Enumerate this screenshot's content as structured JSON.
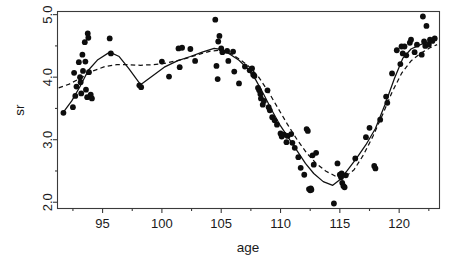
{
  "chart_data": {
    "type": "scatter",
    "title": "",
    "xlabel": "age",
    "ylabel": "sr",
    "xlim": [
      91.2,
      123.4
    ],
    "ylim": [
      1.9,
      5.05
    ],
    "grid": false,
    "legend": "none",
    "xticks": [
      95,
      100,
      105,
      110,
      115,
      120
    ],
    "xtick_labels": [
      "95",
      "100",
      "105",
      "110",
      "115",
      "120"
    ],
    "xminor_ticks": [
      92.5,
      97.5,
      102.5,
      107.5,
      112.5,
      117.5,
      122.5
    ],
    "yticks": [
      2.0,
      3.0,
      4.0,
      5.0
    ],
    "ytick_labels": [
      "2.0",
      "3.0",
      "4.0",
      "5.0"
    ],
    "yminor_ticks": [
      2.5,
      3.5,
      4.5
    ],
    "marker": "filled-circle",
    "marker_color": "#0d0d0d",
    "points": [
      [
        91.7,
        3.43
      ],
      [
        92.5,
        3.52
      ],
      [
        92.6,
        4.07
      ],
      [
        92.7,
        3.7
      ],
      [
        92.8,
        3.85
      ],
      [
        93.0,
        4.24
      ],
      [
        93.1,
        4.0
      ],
      [
        93.15,
        3.92
      ],
      [
        93.2,
        3.74
      ],
      [
        93.3,
        4.36
      ],
      [
        93.35,
        4.1
      ],
      [
        93.5,
        4.56
      ],
      [
        93.55,
        4.25
      ],
      [
        93.6,
        3.8
      ],
      [
        93.7,
        3.68
      ],
      [
        93.75,
        4.7
      ],
      [
        93.8,
        4.63
      ],
      [
        93.85,
        4.08
      ],
      [
        94.0,
        3.72
      ],
      [
        94.1,
        3.66
      ],
      [
        95.6,
        4.62
      ],
      [
        95.7,
        4.38
      ],
      [
        98.1,
        3.87
      ],
      [
        98.25,
        3.84
      ],
      [
        100.0,
        4.25
      ],
      [
        100.6,
        4.01
      ],
      [
        101.4,
        4.46
      ],
      [
        101.5,
        4.16
      ],
      [
        101.7,
        4.47
      ],
      [
        102.4,
        4.45
      ],
      [
        102.8,
        4.26
      ],
      [
        104.5,
        4.92
      ],
      [
        104.6,
        4.18
      ],
      [
        104.7,
        3.97
      ],
      [
        104.75,
        4.57
      ],
      [
        104.85,
        4.66
      ],
      [
        105.0,
        4.46
      ],
      [
        105.1,
        4.4
      ],
      [
        105.5,
        4.42
      ],
      [
        105.6,
        4.26
      ],
      [
        106.0,
        4.41
      ],
      [
        106.1,
        4.09
      ],
      [
        106.5,
        3.9
      ],
      [
        107.0,
        4.17
      ],
      [
        107.4,
        4.11
      ],
      [
        107.6,
        4.14
      ],
      [
        107.7,
        4.04
      ],
      [
        107.8,
        4.02
      ],
      [
        108.1,
        3.83
      ],
      [
        108.2,
        3.79
      ],
      [
        108.3,
        3.73
      ],
      [
        108.35,
        3.66
      ],
      [
        108.5,
        3.56
      ],
      [
        108.6,
        3.62
      ],
      [
        108.9,
        3.79
      ],
      [
        109.0,
        3.52
      ],
      [
        109.1,
        3.47
      ],
      [
        109.3,
        3.36
      ],
      [
        109.5,
        3.31
      ],
      [
        109.7,
        3.24
      ],
      [
        110.0,
        3.1
      ],
      [
        110.1,
        3.05
      ],
      [
        110.3,
        3.08
      ],
      [
        110.5,
        2.96
      ],
      [
        110.6,
        3.06
      ],
      [
        110.9,
        3.09
      ],
      [
        111.0,
        2.95
      ],
      [
        111.2,
        2.87
      ],
      [
        111.5,
        2.72
      ],
      [
        111.7,
        2.55
      ],
      [
        112.0,
        2.44
      ],
      [
        112.2,
        3.17
      ],
      [
        112.3,
        3.14
      ],
      [
        112.4,
        2.21
      ],
      [
        112.5,
        2.19
      ],
      [
        112.55,
        2.22
      ],
      [
        112.6,
        2.2
      ],
      [
        112.7,
        2.75
      ],
      [
        112.8,
        2.6
      ],
      [
        113.0,
        2.79
      ],
      [
        114.5,
        1.98
      ],
      [
        114.8,
        2.62
      ],
      [
        115.0,
        2.44
      ],
      [
        115.1,
        2.4
      ],
      [
        115.15,
        2.46
      ],
      [
        115.2,
        2.31
      ],
      [
        115.3,
        2.26
      ],
      [
        115.4,
        2.24
      ],
      [
        115.5,
        2.43
      ],
      [
        116.3,
        2.7
      ],
      [
        117.2,
        3.04
      ],
      [
        117.5,
        3.19
      ],
      [
        117.9,
        2.58
      ],
      [
        118.0,
        2.54
      ],
      [
        118.4,
        3.32
      ],
      [
        118.9,
        3.69
      ],
      [
        119.0,
        3.59
      ],
      [
        119.4,
        4.06
      ],
      [
        119.8,
        4.43
      ],
      [
        120.1,
        4.21
      ],
      [
        120.2,
        4.49
      ],
      [
        120.3,
        4.38
      ],
      [
        120.45,
        4.49
      ],
      [
        120.6,
        4.35
      ],
      [
        120.9,
        4.55
      ],
      [
        121.0,
        4.6
      ],
      [
        121.3,
        4.4
      ],
      [
        121.5,
        4.52
      ],
      [
        121.9,
        4.36
      ],
      [
        122.0,
        4.97
      ],
      [
        122.1,
        4.57
      ],
      [
        122.2,
        4.5
      ],
      [
        122.3,
        4.82
      ],
      [
        122.5,
        4.52
      ],
      [
        122.6,
        4.6
      ],
      [
        122.8,
        4.58
      ],
      [
        123.0,
        4.62
      ]
    ],
    "series": [
      {
        "name": "solid-fit",
        "style": "solid",
        "x": [
          91.7,
          92.4,
          93.1,
          93.8,
          94.6,
          95.6,
          96.4,
          97.2,
          98.2,
          99.2,
          100.2,
          101.3,
          102.4,
          103.4,
          104.4,
          105.1,
          105.8,
          106.5,
          107.2,
          107.9,
          108.6,
          109.3,
          110.0,
          110.7,
          111.4,
          112.1,
          112.8,
          113.6,
          114.4,
          115.0,
          115.6,
          116.4,
          117.2,
          118.0,
          118.8,
          119.6,
          120.3,
          121.0,
          121.8,
          122.5,
          123.1
        ],
        "y": [
          3.44,
          3.62,
          3.85,
          4.11,
          4.28,
          4.4,
          4.33,
          4.14,
          3.88,
          4.02,
          4.16,
          4.26,
          4.33,
          4.4,
          4.46,
          4.44,
          4.36,
          4.27,
          4.14,
          3.96,
          3.72,
          3.46,
          3.22,
          3.02,
          2.82,
          2.62,
          2.46,
          2.33,
          2.27,
          2.36,
          2.5,
          2.7,
          2.92,
          3.18,
          3.56,
          3.98,
          4.3,
          4.45,
          4.52,
          4.57,
          4.6
        ]
      },
      {
        "name": "dashed-fit",
        "style": "dashed",
        "x": [
          91.3,
          92.2,
          93.2,
          94.2,
          95.2,
          96.2,
          97.2,
          98.2,
          99.2,
          100.2,
          101.2,
          102.2,
          103.2,
          104.2,
          105.0,
          105.8,
          106.6,
          107.4,
          108.2,
          109.0,
          109.8,
          110.6,
          111.4,
          112.2,
          113.0,
          113.8,
          114.6,
          115.4,
          116.2,
          117.0,
          117.8,
          118.6,
          119.4,
          120.2,
          121.0,
          121.8,
          122.6,
          123.2
        ],
        "y": [
          3.83,
          3.89,
          3.99,
          4.1,
          4.17,
          4.2,
          4.2,
          4.19,
          4.2,
          4.22,
          4.26,
          4.31,
          4.37,
          4.42,
          4.43,
          4.38,
          4.28,
          4.16,
          3.99,
          3.76,
          3.5,
          3.24,
          3.0,
          2.79,
          2.62,
          2.5,
          2.42,
          2.4,
          2.52,
          2.76,
          3.06,
          3.4,
          3.76,
          4.06,
          4.26,
          4.38,
          4.47,
          4.52
        ]
      }
    ]
  },
  "axes": {
    "x_title": "age",
    "y_title": "sr"
  }
}
